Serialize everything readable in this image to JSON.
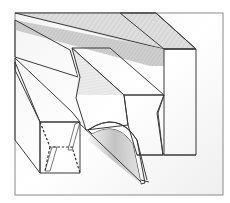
{
  "figure": {
    "type": "technical-illustration",
    "frame": {
      "x": 15,
      "y": 13,
      "width": 208,
      "height": 182,
      "stroke": "#8a8a8a"
    },
    "colors": {
      "background": "#ffffff",
      "wood_light": "#e6e6e6",
      "wood_mid": "#d2d2d2",
      "wood_dark": "#bdbdbd",
      "edge": "#3a3a3a",
      "blade": "#c8c8c8"
    },
    "parts": [
      {
        "name": "long-back-beam",
        "description": "tall rectangular beam running diagonally, top-right"
      },
      {
        "name": "middle-notched-block",
        "description": "block with angled notch sitting over the blade"
      },
      {
        "name": "left-channel-block",
        "description": "hollow channel with dashed hidden edges, lower-left"
      },
      {
        "name": "curved-blade",
        "description": "arched cutting blade in the groove"
      }
    ]
  }
}
